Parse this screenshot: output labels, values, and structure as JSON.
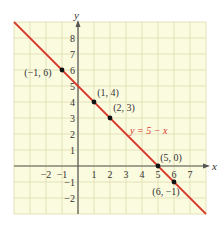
{
  "chart_data": {
    "type": "line",
    "title": "",
    "xlabel": "x",
    "ylabel": "y",
    "xlim": [
      -4,
      8
    ],
    "ylim": [
      -3,
      9
    ],
    "grid": true,
    "x_ticks": [
      "-2",
      "-1",
      "1",
      "2",
      "3",
      "4",
      "5",
      "6",
      "7"
    ],
    "y_ticks": [
      "8",
      "7",
      "6",
      "5",
      "4",
      "3",
      "2",
      "1",
      "-1",
      "-2"
    ],
    "series": [
      {
        "name": "y = 5 - x",
        "equation": "y = 5 − x",
        "color": "#d9392b",
        "slope": -1,
        "intercept": 5
      }
    ],
    "points": [
      {
        "x": -1,
        "y": 6,
        "label": "(−1, 6)"
      },
      {
        "x": 1,
        "y": 4,
        "label": "(1, 4)"
      },
      {
        "x": 2,
        "y": 3,
        "label": "(2, 3)"
      },
      {
        "x": 5,
        "y": 0,
        "label": "(5, 0)"
      },
      {
        "x": 6,
        "y": -1,
        "label": "(6, −1)"
      }
    ],
    "colors": {
      "grid_background": "#fbfbe0",
      "grid_lines": "#e2e2b8",
      "axis": "#555555",
      "line": "#d9392b",
      "point": "#111111"
    }
  }
}
